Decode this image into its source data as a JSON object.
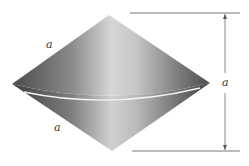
{
  "figure": {
    "labels": {
      "upper_slant": "a",
      "lower_slant": "a",
      "height_dimension": "a"
    },
    "colors": {
      "background": "#ffffff",
      "cone_dark": "#5a5a5a",
      "cone_light": "#d8d8d8",
      "rim_highlight": "#f4f4f4",
      "dimension_line": "#555555"
    }
  }
}
